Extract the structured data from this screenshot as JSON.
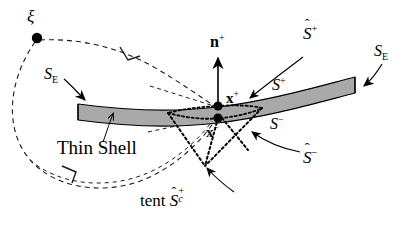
{
  "figure": {
    "background_color": "#ffffff",
    "shell_fill": "#a8a8a8",
    "stroke_color": "#000000"
  },
  "labels": {
    "xi": "ξ",
    "shell_name": "Thin Shell",
    "s_e_left": "S",
    "s_e_left_sub": "E",
    "s_e_right": "S",
    "s_e_right_sub": "E",
    "n_plus": "n",
    "n_plus_sup": "+",
    "x_plus": "x",
    "x_plus_sup": "+",
    "x_minus": "x",
    "x_minus_sup": "−",
    "s_plus": "S",
    "s_plus_sup": "+",
    "s_minus": "S",
    "s_minus_sup": "−",
    "s_hat_plus": "S",
    "s_hat_plus_sup": "+",
    "s_hat_plus_hat": "ˆ",
    "s_hat_minus": "S",
    "s_hat_minus_sup": "−",
    "s_hat_minus_hat": "ˆ",
    "tent_word": "tent",
    "tent_s": "S",
    "tent_hat": "ˆ",
    "tent_sup": "+",
    "tent_sub": "c"
  },
  "points": {
    "xi_dot": {
      "x": 37,
      "y": 38,
      "r": 5
    },
    "x_plus_dot": {
      "x": 218,
      "y": 106,
      "r": 4.5
    },
    "x_minus_dot": {
      "x": 218,
      "y": 118,
      "r": 4.5
    }
  },
  "geometry": {
    "shell_top_path": "M 78,105 C 130,112 175,113 218,108 C 268,102 315,88 355,78",
    "shell_bot_path": "M 78,115 C 130,122 175,123 218,118 C 268,112 315,98 355,93",
    "dashed_outer_loop": "M 37,38 C 95,40 150,62 190,92 C 205,103 212,106 218,108",
    "dashed_left_arc": "M 37,38 C 10,70 5,120 30,160 C 60,205 130,210 175,185 C 195,172 210,145 218,120",
    "normal_arrow": {
      "x1": 218,
      "y1": 106,
      "x2": 218,
      "y2": 57
    },
    "tent_apex": {
      "x": 205,
      "y": 166
    },
    "tent_left": {
      "x": 168,
      "y": 122
    },
    "tent_right": {
      "x": 258,
      "y": 122
    }
  },
  "annotations": [
    {
      "name": "s-e-left-leader",
      "path": "M 62,76 C 70,82 78,90 86,99"
    },
    {
      "name": "s-e-right-leader",
      "path": "M 381,62 C 372,72 366,80 361,85"
    },
    {
      "name": "s-hat-plus-leader",
      "path": "M 300,55 C 280,68 262,82 248,95"
    },
    {
      "name": "s-hat-minus-leader",
      "path": "M 300,152 C 285,148 265,140 250,130"
    },
    {
      "name": "tent-leader",
      "path": "M 232,190 C 220,182 212,175 206,168"
    },
    {
      "name": "thin-shell-leader",
      "path": "M 105,140 C 110,128 114,120 118,113"
    }
  ]
}
